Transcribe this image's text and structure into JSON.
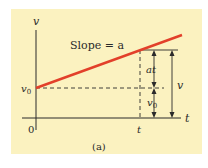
{
  "figure": {
    "caption": "(a)",
    "axes": {
      "y_label": "v",
      "x_label": "t",
      "origin_label": "0",
      "y_intercept_label": "v",
      "y_intercept_subscript": "0",
      "x_tick_label": "t"
    },
    "line": {
      "annotation": "Slope = a",
      "color": "#e2402a"
    },
    "dimensions": {
      "upper_segment": "at",
      "lower_segment_label": "v",
      "lower_segment_subscript": "0",
      "total": "v"
    },
    "colors": {
      "background": "#fbf2c0",
      "axis": "#2a2a2a"
    }
  }
}
